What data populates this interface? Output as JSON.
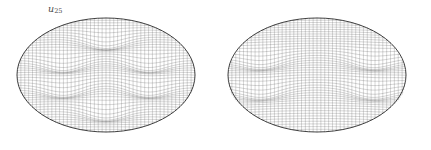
{
  "figure": {
    "background_color": "#ffffff",
    "width": 431,
    "height": 150,
    "mesh_color": "#555555",
    "outline_color": "#2b2b2b",
    "label_color": "#4a4a4a"
  },
  "panels": [
    {
      "id": "u25",
      "label_base": "u",
      "label_sub": "25",
      "label_full": "u25",
      "domain_shape": "ellipse",
      "center_x": 106,
      "center_y": 75,
      "radius_x": 89,
      "radius_y": 57
    },
    {
      "id": "u17",
      "label_base": "u",
      "label_sub": "17",
      "label_full": "u17",
      "domain_shape": "ellipse",
      "center_x": 102,
      "center_y": 75,
      "radius_x": 89,
      "radius_y": 57
    }
  ],
  "chart_data": [
    {
      "type": "surface",
      "id": "u25",
      "title": "u25",
      "description": "Wireframe surface mesh of the 25th Dirichlet eigenfunction on an elliptical domain, drawn as a criss-cross quadrilateral grid over an ellipse.",
      "domain": "ellipse",
      "domain_semi_axis_x": 1.0,
      "domain_semi_axis_y": 0.64,
      "mesh_lines_u": 46,
      "mesh_lines_v": 46,
      "grid": true,
      "legend": false,
      "xlabel": "",
      "ylabel": "",
      "zlabel": "",
      "nodal_feature_count": 6,
      "nodal_features": [
        {
          "x": 0.0,
          "y": 0.62,
          "kind": "dimple"
        },
        {
          "x": -0.47,
          "y": 0.22,
          "kind": "dimple"
        },
        {
          "x": 0.47,
          "y": 0.22,
          "kind": "dimple"
        },
        {
          "x": -0.47,
          "y": -0.22,
          "kind": "dimple"
        },
        {
          "x": 0.47,
          "y": -0.22,
          "kind": "dimple"
        },
        {
          "x": 0.0,
          "y": -0.62,
          "kind": "dimple"
        }
      ],
      "amplitude": 0.17,
      "angular_mode": 4,
      "radial_mode": 3
    },
    {
      "type": "surface",
      "id": "u17",
      "title": "u17",
      "description": "Wireframe surface mesh of the 17th Dirichlet eigenfunction on an elliptical domain, drawn as a criss-cross quadrilateral grid over an ellipse.",
      "domain": "ellipse",
      "domain_semi_axis_x": 1.0,
      "domain_semi_axis_y": 0.64,
      "mesh_lines_u": 46,
      "mesh_lines_v": 46,
      "grid": true,
      "legend": false,
      "xlabel": "",
      "ylabel": "",
      "zlabel": "",
      "nodal_feature_count": 4,
      "nodal_features": [
        {
          "x": -0.62,
          "y": 0.26,
          "kind": "streak"
        },
        {
          "x": 0.62,
          "y": 0.26,
          "kind": "streak"
        },
        {
          "x": -0.62,
          "y": -0.26,
          "kind": "streak"
        },
        {
          "x": 0.62,
          "y": -0.26,
          "kind": "streak"
        }
      ],
      "amplitude": 0.15,
      "angular_mode": 3,
      "radial_mode": 2
    }
  ]
}
